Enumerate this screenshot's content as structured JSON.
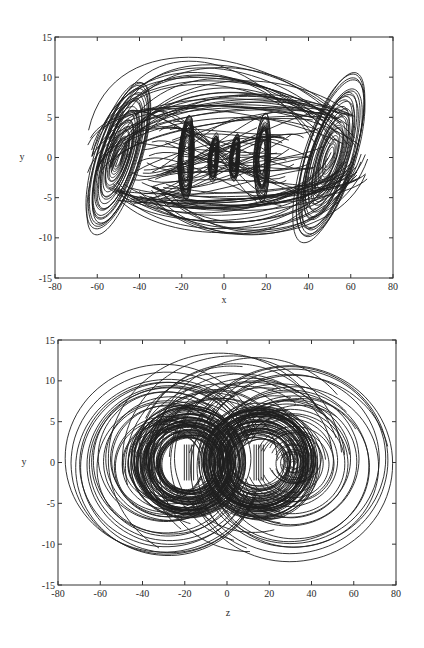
{
  "chart_data": [
    {
      "type": "line",
      "subtype": "phase-portrait",
      "title": "",
      "xlabel": "x",
      "ylabel": "y",
      "xlim": [
        -80,
        80
      ],
      "ylim": [
        -15,
        15
      ],
      "xticks": [
        -80,
        -60,
        -40,
        -20,
        0,
        20,
        40,
        60,
        80
      ],
      "yticks": [
        -15,
        -10,
        -5,
        0,
        5,
        10,
        15
      ],
      "grid": false,
      "legend": null,
      "line_color": "#1e1e1e",
      "frame_px": {
        "left": 55,
        "top": 37,
        "right": 393,
        "bottom": 278
      },
      "features": {
        "outer_scrolls": [
          {
            "center": [
              -50,
              0
            ],
            "rx_max": 20,
            "ry_max": 9,
            "tilt_deg": 55
          },
          {
            "center": [
              50,
              0
            ],
            "rx_max": 18,
            "ry_max": 10,
            "tilt_deg": 55
          }
        ],
        "inner_lobes": [
          {
            "center": [
              -18,
              0
            ],
            "rx": 4,
            "ry": 5.5
          },
          {
            "center": [
              -5,
              0
            ],
            "rx": 2.5,
            "ry": 3
          },
          {
            "center": [
              5,
              0
            ],
            "rx": 2.5,
            "ry": 3
          },
          {
            "center": [
              18,
              0
            ],
            "rx": 4,
            "ry": 5.5
          }
        ],
        "y_range_observed": [
          -10.5,
          12
        ],
        "x_range_observed": [
          -70,
          68
        ]
      }
    },
    {
      "type": "line",
      "subtype": "phase-portrait",
      "title": "",
      "xlabel": "z",
      "ylabel": "y",
      "xlim": [
        -80,
        80
      ],
      "ylim": [
        -15,
        15
      ],
      "xticks": [
        -80,
        -60,
        -40,
        -20,
        0,
        20,
        40,
        60,
        80
      ],
      "yticks": [
        -15,
        -10,
        -5,
        0,
        5,
        10,
        15
      ],
      "grid": false,
      "legend": null,
      "line_color": "#1e1e1e",
      "frame_px": {
        "left": 58,
        "top": 340,
        "right": 396,
        "bottom": 585
      },
      "features": {
        "dense_rings": [
          {
            "center": [
              -18,
              0
            ],
            "r_min": 3,
            "r_max": 7
          },
          {
            "center": [
              15,
              0
            ],
            "r_min": 3,
            "r_max": 7
          }
        ],
        "outer_arcs": [
          {
            "center": [
              -30,
              0
            ],
            "r_min": 4,
            "r_max": 11.5
          },
          {
            "center": [
              32,
              0
            ],
            "r_min": 0.5,
            "r_max": 12
          }
        ],
        "small_spiral_center": [
          32,
          0
        ],
        "y_range_observed": [
          -12,
          12
        ],
        "x_range_observed": [
          -52,
          72
        ]
      }
    }
  ],
  "labels": {
    "top": {
      "xlabel": "x",
      "ylabel": "y"
    },
    "bottom": {
      "xlabel": "z",
      "ylabel": "y"
    }
  }
}
